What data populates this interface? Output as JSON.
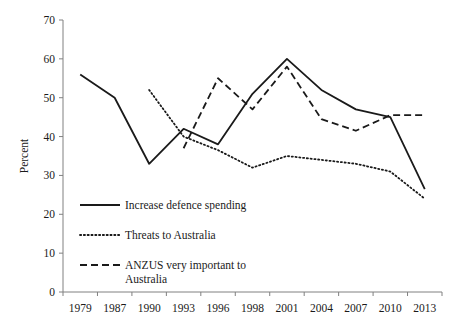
{
  "chart_data": {
    "type": "line",
    "title": "",
    "subtitle": "",
    "xlabel": "",
    "ylabel": "Percent",
    "categories": [
      "1979",
      "1987",
      "1990",
      "1993",
      "1996",
      "1998",
      "2001",
      "2004",
      "2007",
      "2010",
      "2013"
    ],
    "ylim": [
      0,
      70
    ],
    "yticks": [
      0,
      10,
      20,
      30,
      40,
      50,
      60,
      70
    ],
    "ytick_labels": [
      "0",
      "10",
      "20",
      "30",
      "40",
      "50",
      "60",
      "70"
    ],
    "grid": false,
    "legend_position": "inside-lower-left",
    "series": [
      {
        "name": "Increase defence spending",
        "style": "solid",
        "color": "#1a1a1a",
        "values": [
          56,
          50,
          33,
          42,
          38,
          51,
          60,
          52,
          47,
          45,
          26.5
        ]
      },
      {
        "name": "Threats to Australia",
        "style": "dotted",
        "color": "#1a1a1a",
        "values": [
          null,
          null,
          52,
          40,
          36.5,
          32,
          35,
          34,
          33,
          31,
          24
        ]
      },
      {
        "name": "ANZUS very important to Australia",
        "style": "dashed",
        "color": "#1a1a1a",
        "values": [
          null,
          null,
          null,
          37,
          55,
          47,
          58,
          44.5,
          41.5,
          45.5,
          45.5
        ]
      }
    ]
  },
  "legend": {
    "items": [
      {
        "label": "Increase defence spending",
        "style": "solid"
      },
      {
        "label": "Threats to Australia",
        "style": "dotted"
      },
      {
        "label": "ANZUS very important to",
        "label2": "Australia",
        "style": "dashed"
      }
    ]
  }
}
